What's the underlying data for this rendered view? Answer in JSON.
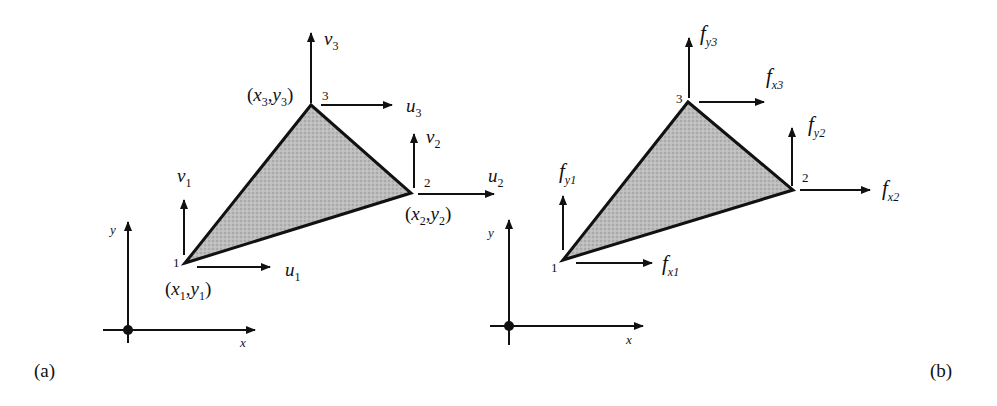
{
  "colors": {
    "stroke": "#111111",
    "fill": "#b8b8b8",
    "background": "#ffffff"
  },
  "panel_a": {
    "caption": "(a)",
    "axes": {
      "x_label": "x",
      "y_label": "y"
    },
    "nodes": [
      {
        "id": "1",
        "coord_label": "(x1,y1)",
        "x_sub": "1",
        "y_sub": "1",
        "u": "u",
        "u_sub": "1",
        "v": "v",
        "v_sub": "1"
      },
      {
        "id": "2",
        "coord_label": "(x2,y2)",
        "x_sub": "2",
        "y_sub": "2",
        "u": "u",
        "u_sub": "2",
        "v": "v",
        "v_sub": "2"
      },
      {
        "id": "3",
        "coord_label": "(x3,y3)",
        "x_sub": "3",
        "y_sub": "3",
        "u": "u",
        "u_sub": "3",
        "v": "v",
        "v_sub": "3"
      }
    ]
  },
  "panel_b": {
    "caption": "(b)",
    "axes": {
      "x_label": "x",
      "y_label": "y"
    },
    "nodes": [
      {
        "id": "1",
        "fx": "f",
        "fx_sub": "x1",
        "fy": "f",
        "fy_sub": "y1"
      },
      {
        "id": "2",
        "fx": "f",
        "fx_sub": "x2",
        "fy": "f",
        "fy_sub": "y2"
      },
      {
        "id": "3",
        "fx": "f",
        "fx_sub": "x3",
        "fy": "f",
        "fy_sub": "y3"
      }
    ]
  }
}
